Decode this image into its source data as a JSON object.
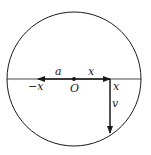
{
  "diagram": {
    "type": "circle-with-vectors",
    "circle": {
      "cx": 74,
      "cy": 79,
      "r": 67
    },
    "stroke_color": "#1a1a1a",
    "background": "#ffffff",
    "labels": {
      "a": "a",
      "x_top": "x",
      "neg_x": "−x",
      "origin": "O",
      "x_right": "x",
      "v": "v"
    },
    "vectors": [
      {
        "name": "a",
        "from": [
          74,
          79
        ],
        "to": [
          38,
          79
        ]
      },
      {
        "name": "x",
        "from": [
          74,
          79
        ],
        "to": [
          110,
          79
        ]
      },
      {
        "name": "v",
        "from": [
          110,
          79
        ],
        "to": [
          110,
          133
        ]
      }
    ]
  }
}
